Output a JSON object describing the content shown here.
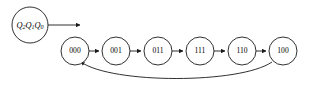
{
  "diagram": {
    "type": "state-transition-diagram",
    "background_color": "#ffffff",
    "stroke_color": "#1a1a1a",
    "text_color": "#000000",
    "legend": {
      "name": "state-register-legend",
      "label_plain": "Q2Q1Q0",
      "parts": [
        {
          "base": "Q",
          "sub": "2"
        },
        {
          "base": "Q",
          "sub": "1"
        },
        {
          "base": "Q",
          "sub": "0"
        }
      ],
      "cx": 30,
      "cy": 25,
      "r": 18,
      "pointer": {
        "name": "legend-pointer-arrow",
        "x1": 48,
        "y1": 25,
        "x2": 82,
        "y2": 25
      }
    },
    "nodes": [
      {
        "id": "s0",
        "label": "000",
        "cx": 75,
        "cy": 51,
        "r": 14
      },
      {
        "id": "s1",
        "label": "001",
        "cx": 116,
        "cy": 51,
        "r": 14
      },
      {
        "id": "s2",
        "label": "011",
        "cx": 158,
        "cy": 51,
        "r": 14
      },
      {
        "id": "s3",
        "label": "111",
        "cx": 200,
        "cy": 51,
        "r": 14
      },
      {
        "id": "s4",
        "label": "110",
        "cx": 242,
        "cy": 51,
        "r": 14
      },
      {
        "id": "s5",
        "label": "100",
        "cx": 283,
        "cy": 51,
        "r": 14
      }
    ],
    "edges": [
      {
        "name": "edge-000-to-001",
        "from": "000",
        "to": "001",
        "shape": "straight",
        "x1": 89,
        "y1": 51,
        "x2": 100,
        "y2": 51
      },
      {
        "name": "edge-001-to-011",
        "from": "001",
        "to": "011",
        "shape": "straight",
        "x1": 130,
        "y1": 51,
        "x2": 142,
        "y2": 51
      },
      {
        "name": "edge-011-to-111",
        "from": "011",
        "to": "111",
        "shape": "straight",
        "x1": 172,
        "y1": 51,
        "x2": 184,
        "y2": 51
      },
      {
        "name": "edge-111-to-110",
        "from": "111",
        "to": "110",
        "shape": "straight",
        "x1": 214,
        "y1": 51,
        "x2": 226,
        "y2": 51
      },
      {
        "name": "edge-110-to-100",
        "from": "110",
        "to": "100",
        "shape": "straight",
        "x1": 256,
        "y1": 51,
        "x2": 267,
        "y2": 51
      },
      {
        "name": "edge-100-to-000-feedback",
        "from": "100",
        "to": "000",
        "shape": "curved-arc",
        "path": "M 272 62 C 240 84, 110 84, 80 62"
      }
    ]
  }
}
